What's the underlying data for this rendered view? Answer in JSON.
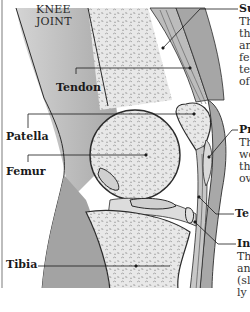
{
  "diagram": {
    "title_line1": "KNEE",
    "title_line2": "JOINT",
    "left_labels": {
      "tendon": "Tendon",
      "patella": "Patella",
      "femur": "Femur",
      "tibia": "Tibia"
    },
    "right_callouts": [
      {
        "heading": "Su",
        "lines": [
          "Th",
          "th",
          "an",
          "fe",
          "te",
          "of"
        ]
      },
      {
        "heading": "Pr",
        "lines": [
          "Th",
          "wo",
          "th",
          "ov"
        ]
      },
      {
        "heading": "Te",
        "lines": []
      },
      {
        "heading": "In",
        "lines": [
          "Th",
          "an",
          "(sl",
          "ly"
        ]
      }
    ],
    "colors": {
      "soft_tissue": "#a9a9a9",
      "bone": "#e6e6e6",
      "bone_texture": "#9a9a9a",
      "outline": "#2b2b2b",
      "background": "#ffffff"
    }
  }
}
